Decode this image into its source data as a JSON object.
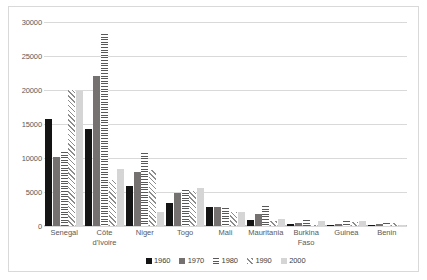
{
  "chart_data": {
    "type": "bar",
    "title": "",
    "subtitle": "",
    "xlabel": "",
    "ylabel": "",
    "ylim": [
      0,
      30000
    ],
    "ytick_values": [
      0,
      5000,
      10000,
      15000,
      20000,
      25000,
      30000
    ],
    "ytick_labels": [
      "0",
      "5000",
      "10000",
      "15000",
      "20000",
      "25000",
      "30000"
    ],
    "grid": true,
    "legend_position": "bottom",
    "categories": [
      "Senegal",
      "Côte\nd'Ivoire",
      "Niger",
      "Togo",
      "Mali",
      "Mauritania",
      "Burkina\nFaso",
      "Guinea",
      "Benin"
    ],
    "series": [
      {
        "name": "1960",
        "color": "#141414",
        "pattern": "solid",
        "values": [
          15800,
          14200,
          5900,
          3400,
          2800,
          950,
          250,
          200,
          180
        ]
      },
      {
        "name": "1970",
        "color": "#767171",
        "pattern": "solid",
        "values": [
          10200,
          22000,
          7900,
          4900,
          2750,
          1800,
          400,
          320,
          250
        ]
      },
      {
        "name": "1980",
        "color": "#595959",
        "pattern": "horizontal-stripes",
        "values": [
          10900,
          28200,
          10700,
          5300,
          2600,
          2900,
          900,
          700,
          400
        ]
      },
      {
        "name": "1990",
        "color": "#8c8c8c",
        "pattern": "diagonal-stripes",
        "values": [
          20000,
          6800,
          8200,
          5200,
          2100,
          700,
          220,
          550,
          500
        ]
      },
      {
        "name": "2000",
        "color": "#d5d5d5",
        "pattern": "solid",
        "values": [
          19800,
          8400,
          2100,
          5600,
          2100,
          1100,
          750,
          700,
          200
        ]
      }
    ]
  }
}
